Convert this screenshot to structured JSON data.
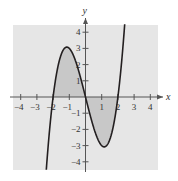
{
  "chart_data": {
    "type": "line",
    "title": "",
    "function": "f(x) = x^3 - 4x",
    "xlabel": "x",
    "ylabel": "y",
    "xlim": [
      -4.5,
      4.5
    ],
    "ylim": [
      -4.5,
      4.5
    ],
    "x_ticks": [
      -4,
      -3,
      -2,
      -1,
      1,
      2,
      3,
      4
    ],
    "y_ticks": [
      -4,
      -3,
      -2,
      -1,
      1,
      2,
      3,
      4
    ],
    "x_tick_labels": [
      "−4",
      "−3",
      "−2",
      "−1",
      "1",
      "2",
      "3",
      "4"
    ],
    "y_tick_labels": [
      "−4",
      "−3",
      "−2",
      "−1",
      "1",
      "2",
      "3",
      "4"
    ],
    "shaded_region": {
      "from": -2,
      "to": 2,
      "between": "curve and x-axis"
    },
    "key_points": [
      {
        "x": -2,
        "y": 0
      },
      {
        "x": -1.15,
        "y": 3.08
      },
      {
        "x": 0,
        "y": 0
      },
      {
        "x": 1.15,
        "y": -3.08
      },
      {
        "x": 2,
        "y": 0
      }
    ],
    "grid": false,
    "colors": {
      "background": "#e6e6e6",
      "shade": "#c8c8c8",
      "curve": "#231f20",
      "axis": "#555555"
    }
  }
}
